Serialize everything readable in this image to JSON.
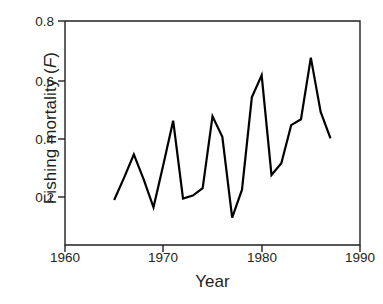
{
  "chart_data": {
    "type": "line",
    "title": "",
    "xlabel": "Year",
    "ylabel": "Fishing mortality (F)",
    "ylabel_plain": "Fishing mortality",
    "ylabel_symbol": "F",
    "xlim": [
      1960,
      1990
    ],
    "ylim": [
      0.1,
      0.8
    ],
    "xticks": [
      1960,
      1970,
      1980,
      1990
    ],
    "xtick_labels": [
      "1960",
      "1970",
      "1980",
      "1990"
    ],
    "yticks": [
      0.2,
      0.4,
      0.6,
      0.8
    ],
    "ytick_labels": [
      "0.2",
      "0.4",
      "0.6",
      "0.8"
    ],
    "grid": false,
    "legend": false,
    "line_color": "#000000",
    "line_width": 2.2,
    "x": [
      1965,
      1966,
      1967,
      1968,
      1969,
      1970,
      1971,
      1972,
      1973,
      1974,
      1975,
      1976,
      1977,
      1978,
      1979,
      1980,
      1981,
      1982,
      1983,
      1984,
      1985,
      1986,
      1987
    ],
    "y": [
      0.19,
      0.265,
      0.345,
      0.26,
      0.165,
      0.31,
      0.46,
      0.195,
      0.205,
      0.23,
      0.475,
      0.405,
      0.13,
      0.225,
      0.54,
      0.615,
      0.275,
      0.315,
      0.445,
      0.465,
      0.675,
      0.49,
      0.4
    ],
    "series": [
      {
        "name": "Fishing mortality (F)",
        "values": [
          0.19,
          0.265,
          0.345,
          0.26,
          0.165,
          0.31,
          0.46,
          0.195,
          0.205,
          0.23,
          0.475,
          0.405,
          0.13,
          0.225,
          0.54,
          0.615,
          0.275,
          0.315,
          0.445,
          0.465,
          0.675,
          0.49,
          0.4
        ]
      }
    ]
  },
  "axis": {
    "y_tick_0": "0.8",
    "y_tick_1": "0.6",
    "y_tick_2": "0.4",
    "y_tick_3": "0.2",
    "x_tick_0": "1960",
    "x_tick_1": "1970",
    "x_tick_2": "1980",
    "x_tick_3": "1990",
    "x_title": "Year",
    "y_title_text": "Fishing mortality (",
    "y_title_symbol": "F",
    "y_title_close": ")"
  }
}
